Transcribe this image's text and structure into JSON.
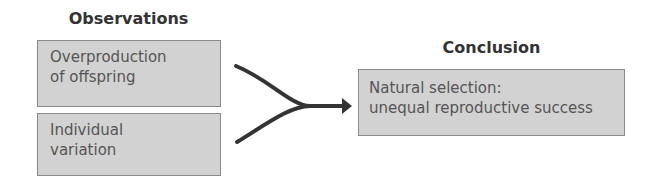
{
  "observations": {
    "title": "Observations",
    "items": [
      {
        "label": "Overproduction\nof offspring",
        "line1": "Overproduction",
        "line2": "of offspring"
      },
      {
        "label": "Individual\nvariation",
        "line1": "Individual",
        "line2": "variation"
      }
    ]
  },
  "conclusion": {
    "title": "Conclusion",
    "line1": "Natural selection:",
    "line2": "unequal reproductive success"
  },
  "colors": {
    "box_fill": "#d2d2d2",
    "box_border": "#8a8a8a",
    "arrow": "#333333",
    "text": "#555555",
    "title": "#333333"
  }
}
